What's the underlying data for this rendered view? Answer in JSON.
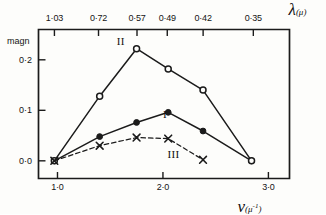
{
  "chart_data": {
    "type": "line",
    "title": "",
    "ylabel": "magn",
    "ylim": [
      -0.035,
      0.26
    ],
    "y_ticks": [
      {
        "value": 0.2,
        "label": "0·2"
      },
      {
        "value": 0.1,
        "label": "0·1"
      },
      {
        "value": 0.0,
        "label": "0·0"
      }
    ],
    "bottom_axis": {
      "symbol": "ν",
      "unit": "(μ",
      "unit_sup": "-1",
      "unit_close": ")",
      "xlabel": "ν (μ⁻¹)",
      "xlim": [
        0.82,
        3.2
      ],
      "ticks": [
        {
          "value": 1.0,
          "label": "1·0"
        },
        {
          "value": 2.0,
          "label": "2·0"
        },
        {
          "value": 3.0,
          "label": "3·0"
        }
      ]
    },
    "top_axis": {
      "symbol": "λ",
      "unit": "(μ)",
      "xlabel": "λ (μ)",
      "ticks": [
        {
          "nu": 0.971,
          "label": "1·03"
        },
        {
          "nu": 1.389,
          "label": "0·72"
        },
        {
          "nu": 1.754,
          "label": "0·57"
        },
        {
          "nu": 2.041,
          "label": "0·49"
        },
        {
          "nu": 2.381,
          "label": "0·42"
        },
        {
          "nu": 2.857,
          "label": "0·35"
        }
      ]
    },
    "series": [
      {
        "name": "I",
        "label": "I",
        "marker": "filled-circle",
        "linestyle": "solid",
        "label_nu": 2.02,
        "label_magn": 0.093,
        "points": [
          {
            "nu": 0.97,
            "magn": 0.0
          },
          {
            "nu": 1.4,
            "magn": 0.048
          },
          {
            "nu": 1.75,
            "magn": 0.076
          },
          {
            "nu": 2.05,
            "magn": 0.096
          },
          {
            "nu": 2.38,
            "magn": 0.059
          },
          {
            "nu": 2.84,
            "magn": 0.0
          }
        ]
      },
      {
        "name": "II",
        "label": "II",
        "marker": "open-circle",
        "linestyle": "solid",
        "label_nu": 1.6,
        "label_magn": 0.238,
        "points": [
          {
            "nu": 0.97,
            "magn": 0.0
          },
          {
            "nu": 1.4,
            "magn": 0.128
          },
          {
            "nu": 1.75,
            "magn": 0.222
          },
          {
            "nu": 2.05,
            "magn": 0.182
          },
          {
            "nu": 2.38,
            "magn": 0.14
          },
          {
            "nu": 2.84,
            "magn": 0.0
          }
        ]
      },
      {
        "name": "III",
        "label": "III",
        "marker": "cross",
        "linestyle": "dashed",
        "label_nu": 2.1,
        "label_magn": 0.013,
        "points": [
          {
            "nu": 0.97,
            "magn": 0.0
          },
          {
            "nu": 1.4,
            "magn": 0.03
          },
          {
            "nu": 1.75,
            "magn": 0.046
          },
          {
            "nu": 2.05,
            "magn": 0.044
          },
          {
            "nu": 2.38,
            "magn": 0.002
          }
        ]
      }
    ]
  }
}
